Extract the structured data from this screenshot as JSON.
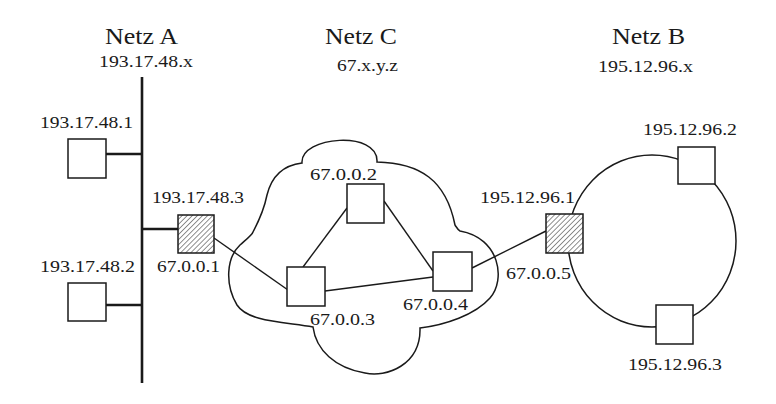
{
  "networks": {
    "a": {
      "title": "Netz A",
      "address": "193.17.48.x",
      "topology": "bus"
    },
    "c": {
      "title": "Netz C",
      "address": "67.x.y.z",
      "topology": "cloud"
    },
    "b": {
      "title": "Netz B",
      "address": "195.12.96.x",
      "topology": "ring"
    }
  },
  "nodes": {
    "a1": {
      "label": "193.17.48.1",
      "type": "host",
      "network": "A"
    },
    "a2": {
      "label": "193.17.48.2",
      "type": "host",
      "network": "A"
    },
    "r1": {
      "label_outer": "193.17.48.3",
      "label_inner": "67.0.0.1",
      "type": "router",
      "networks": [
        "A",
        "C"
      ]
    },
    "c2": {
      "label": "67.0.0.2",
      "type": "node",
      "network": "C"
    },
    "c3": {
      "label": "67.0.0.3",
      "type": "node",
      "network": "C"
    },
    "c4": {
      "label": "67.0.0.4",
      "type": "node",
      "network": "C"
    },
    "r2": {
      "label_outer": "195.12.96.1",
      "label_inner": "67.0.0.5",
      "type": "router",
      "networks": [
        "B",
        "C"
      ]
    },
    "b2": {
      "label": "195.12.96.2",
      "type": "host",
      "network": "B"
    },
    "b3": {
      "label": "195.12.96.3",
      "type": "host",
      "network": "B"
    }
  },
  "edges": [
    [
      "193.17.48.1",
      "Netz A bus"
    ],
    [
      "193.17.48.2",
      "Netz A bus"
    ],
    [
      "193.17.48.3",
      "Netz A bus"
    ],
    [
      "67.0.0.1",
      "67.0.0.3"
    ],
    [
      "67.0.0.3",
      "67.0.0.2"
    ],
    [
      "67.0.0.3",
      "67.0.0.4"
    ],
    [
      "67.0.0.2",
      "67.0.0.4"
    ],
    [
      "67.0.0.4",
      "67.0.0.5"
    ],
    [
      "195.12.96.1",
      "Netz B ring"
    ],
    [
      "195.12.96.2",
      "Netz B ring"
    ],
    [
      "195.12.96.3",
      "Netz B ring"
    ]
  ],
  "colors": {
    "ink": "#1a1a1a",
    "background": "#ffffff"
  }
}
